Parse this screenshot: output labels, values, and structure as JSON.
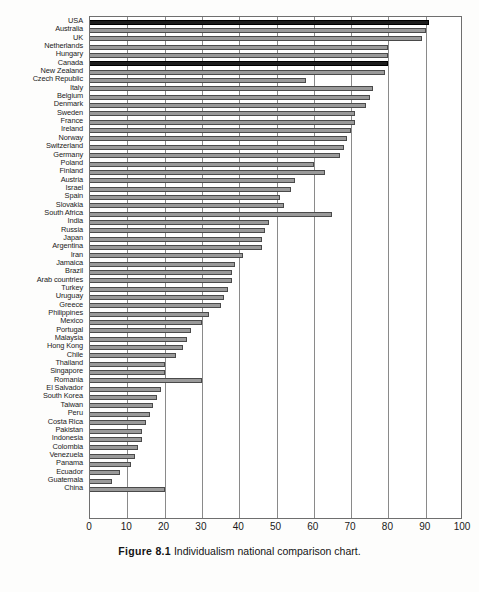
{
  "caption": {
    "figure_number": "Figure 8.1",
    "text": "Individualism national comparison chart."
  },
  "chart_data": {
    "type": "bar",
    "orientation": "horizontal",
    "title": "Individualism national comparison chart",
    "xlabel": "",
    "ylabel": "",
    "xlim": [
      0,
      100
    ],
    "xticks": [
      "0",
      "10",
      "20",
      "30",
      "40",
      "50",
      "60",
      "70",
      "80",
      "90",
      "100"
    ],
    "grid": true,
    "legend": "none",
    "highlight_color": "#1d1d1d",
    "bar_color": "#9a9a9a",
    "highlighted_categories": [
      "USA",
      "Canada"
    ],
    "categories": [
      "USA",
      "Australia",
      "UK",
      "Netherlands",
      "Hungary",
      "Canada",
      "New Zealand",
      "Czech Republic",
      "Italy",
      "Belgium",
      "Denmark",
      "Sweden",
      "France",
      "Ireland",
      "Norway",
      "Switzerland",
      "Germany",
      "Poland",
      "Finland",
      "Austria",
      "Israel",
      "Spain",
      "Slovakia",
      "South Africa",
      "India",
      "Russia",
      "Japan",
      "Argentina",
      "Iran",
      "Jamaica",
      "Brazil",
      "Arab countries",
      "Turkey",
      "Uruguay",
      "Greece",
      "Philippines",
      "Mexico",
      "Portugal",
      "Malaysia",
      "Hong Kong",
      "Chile",
      "Thailand",
      "Singapore",
      "Romania",
      "El Salvador",
      "South Korea",
      "Taiwan",
      "Peru",
      "Costa Rica",
      "Pakistan",
      "Indonesia",
      "Colombia",
      "Venezuela",
      "Panama",
      "Ecuador",
      "Guatemala",
      "China"
    ],
    "values": [
      91,
      90,
      89,
      80,
      80,
      80,
      79,
      58,
      76,
      75,
      74,
      71,
      71,
      70,
      69,
      68,
      67,
      60,
      63,
      55,
      54,
      51,
      52,
      65,
      48,
      47,
      46,
      46,
      41,
      39,
      38,
      38,
      37,
      36,
      35,
      32,
      30,
      27,
      26,
      25,
      23,
      20,
      20,
      30,
      19,
      18,
      17,
      16,
      15,
      14,
      14,
      13,
      12,
      11,
      8,
      6,
      20
    ]
  }
}
